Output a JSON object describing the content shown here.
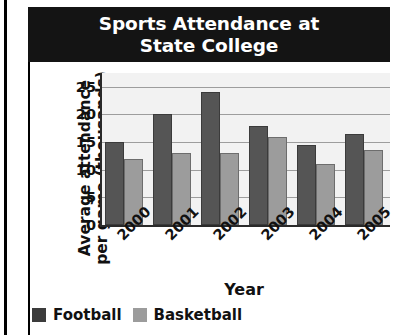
{
  "chart_data": {
    "type": "bar",
    "title": "Sports Attendance at\nState College",
    "xlabel": "Year",
    "ylabel": "Average attendance\nper game (thousands)",
    "categories": [
      "2000",
      "2001",
      "2002",
      "2003",
      "2004",
      "2005"
    ],
    "series": [
      {
        "name": "Football",
        "color": "#555555",
        "values": [
          15,
          20,
          24,
          18,
          14.5,
          16.5
        ]
      },
      {
        "name": "Basketball",
        "color": "#9c9c9c",
        "values": [
          12,
          13,
          13,
          16,
          11,
          13.5
        ]
      }
    ],
    "ylim": [
      0,
      27.5
    ],
    "yticks": [
      0,
      5,
      10,
      15,
      20,
      25
    ],
    "ytick_labels": [
      "0",
      "5",
      "10",
      "15",
      "20",
      "25"
    ],
    "grid": true,
    "legend_position": "bottom-left",
    "xtick_rotation": -45
  },
  "colors": {
    "banner_background": "#141414",
    "banner_text": "#ffffff",
    "plot_background": "#f2f2f2",
    "gridline": "#9d9d9d",
    "axis": "#2a2a2a",
    "football": "#555555",
    "basketball": "#9c9c9c"
  }
}
